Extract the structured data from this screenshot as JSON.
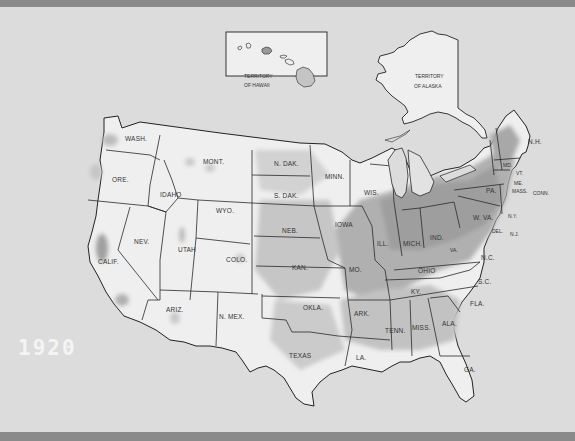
{
  "map": {
    "year_label": "1920",
    "subject": "Population distribution of the United States",
    "insets": {
      "hawaii": {
        "label_line1": "TERRITORY",
        "label_line2": "OF HAWAII"
      },
      "alaska": {
        "label_line1": "TERRITORY",
        "label_line2": "OF ALASKA"
      }
    },
    "states": [
      {
        "id": "wa",
        "label": "WASH."
      },
      {
        "id": "or",
        "label": "ORE."
      },
      {
        "id": "ca",
        "label": "CALIF."
      },
      {
        "id": "id",
        "label": "IDAHO"
      },
      {
        "id": "nv",
        "label": "NEV."
      },
      {
        "id": "mt",
        "label": "MONT."
      },
      {
        "id": "wy",
        "label": "WYO."
      },
      {
        "id": "ut",
        "label": "UTAH"
      },
      {
        "id": "co",
        "label": "COLO."
      },
      {
        "id": "az",
        "label": "ARIZ."
      },
      {
        "id": "nm",
        "label": "N. MEX."
      },
      {
        "id": "nd",
        "label": "N. DAK."
      },
      {
        "id": "sd",
        "label": "S. DAK."
      },
      {
        "id": "ne",
        "label": "NEB."
      },
      {
        "id": "ks",
        "label": "KAN."
      },
      {
        "id": "ok",
        "label": "OKLA."
      },
      {
        "id": "tx",
        "label": "TEXAS"
      },
      {
        "id": "mn",
        "label": "MINN."
      },
      {
        "id": "ia",
        "label": "IOWA"
      },
      {
        "id": "mo",
        "label": "MO."
      },
      {
        "id": "ar",
        "label": "ARK."
      },
      {
        "id": "la",
        "label": "LA."
      },
      {
        "id": "wi",
        "label": "WIS."
      },
      {
        "id": "il",
        "label": "ILL."
      },
      {
        "id": "mi",
        "label": "MICH."
      },
      {
        "id": "in",
        "label": "IND."
      },
      {
        "id": "oh",
        "label": "OHIO"
      },
      {
        "id": "ky",
        "label": "KY."
      },
      {
        "id": "tn",
        "label": "TENN."
      },
      {
        "id": "ms",
        "label": "MISS."
      },
      {
        "id": "al",
        "label": "ALA."
      },
      {
        "id": "ga",
        "label": "GA."
      },
      {
        "id": "fl",
        "label": "FLA."
      },
      {
        "id": "sc",
        "label": "S.C."
      },
      {
        "id": "nc",
        "label": "N.C."
      },
      {
        "id": "va",
        "label": "VA."
      },
      {
        "id": "wv",
        "label": "W. VA."
      },
      {
        "id": "pa",
        "label": "PA."
      },
      {
        "id": "ny",
        "label": "N.Y."
      },
      {
        "id": "nj",
        "label": "N.J."
      },
      {
        "id": "de",
        "label": "DEL."
      },
      {
        "id": "md",
        "label": "MD."
      },
      {
        "id": "vt",
        "label": "VT."
      },
      {
        "id": "nh",
        "label": "N.H."
      },
      {
        "id": "me",
        "label": "ME."
      },
      {
        "id": "ma",
        "label": "MASS."
      },
      {
        "id": "ct",
        "label": "CONN."
      },
      {
        "id": "ri",
        "label": "R.I."
      }
    ],
    "colors": {
      "background": "#dcdcdc",
      "land": "#efefef",
      "density_light": "#c8c8c8",
      "density_dark": "#9a9a9a",
      "border": "#2a2a2a",
      "frame_band": "#8a8a8a",
      "year_text": "#f4f4f4"
    }
  }
}
